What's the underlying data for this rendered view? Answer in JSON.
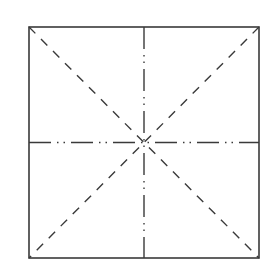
{
  "diagram": {
    "type": "fold-lines-square",
    "background": "#ffffff",
    "stroke_color": "#3a3a3a",
    "square": {
      "x": 29,
      "y": 27,
      "width": 230,
      "height": 231
    },
    "lines": {
      "border": {
        "style": "solid",
        "width": 1.6
      },
      "diagonals": {
        "style": "dashed",
        "dasharray": "9 8",
        "width": 1.4
      },
      "center_cross": {
        "style": "dash-dot-dot",
        "dasharray": "22 6 1.5 5 1.5 6",
        "width": 1.4
      }
    }
  }
}
